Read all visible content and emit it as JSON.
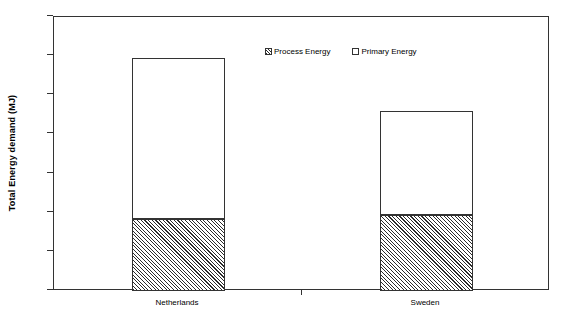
{
  "chart_data": {
    "type": "bar",
    "stacked": true,
    "title": "",
    "subtitle": "",
    "xlabel": "",
    "ylabel": "Total Energy demand (MJ)",
    "categories": [
      "Netherlands",
      "Sweden"
    ],
    "series": [
      {
        "name": "Process Energy",
        "values": [
          3700,
          3900
        ]
      },
      {
        "name": "Primary Energy",
        "values": [
          8200,
          5300
        ]
      }
    ],
    "totals": [
      11900,
      9200
    ],
    "ylim": [
      0,
      14000
    ],
    "ytick_values": [
      0,
      2000,
      4000,
      6000,
      8000,
      10000,
      12000,
      14000
    ],
    "ytick_labels": [
      "0",
      "2000",
      "4000",
      "6000",
      "8000",
      "10000",
      "12000",
      "14000"
    ],
    "grid": false,
    "legend_position": "top-center",
    "colors": {
      "axis": "#333333",
      "process_energy": "#2b2b2b",
      "primary_energy": "#ffffff",
      "background": "#ffffff"
    }
  },
  "legend": {
    "entries": [
      {
        "label": "Process Energy",
        "swatch": "hatched-square-icon"
      },
      {
        "label": "Primary Energy",
        "swatch": "empty-square-icon"
      }
    ]
  },
  "axes": {
    "y_title": "Total Energy demand (MJ)",
    "y_labels": [
      "14000",
      "12000",
      "10000",
      "8000",
      "6000",
      "4000",
      "2000",
      "0"
    ],
    "x_labels": [
      "Netherlands",
      "Sweden"
    ]
  }
}
